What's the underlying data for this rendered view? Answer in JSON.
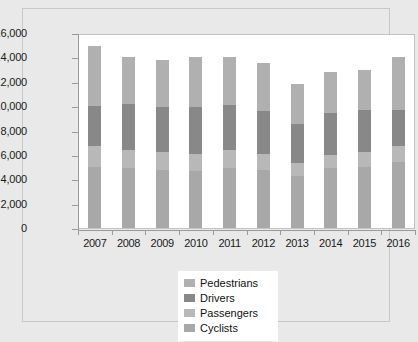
{
  "chart_data": {
    "type": "bar",
    "subtype": "stacked-bar",
    "title": "",
    "xlabel": "",
    "ylabel": "",
    "ylim": [
      0,
      16000
    ],
    "ytick_labels": [
      "16,000",
      "14,000",
      "12,000",
      "10,000",
      "8,000",
      "6,000",
      "4,000",
      "2,000",
      "0"
    ],
    "ytick_values": [
      16000,
      14000,
      12000,
      10000,
      8000,
      6000,
      4000,
      2000,
      0
    ],
    "grid": false,
    "legend_position": "bottom-center",
    "categories": [
      "2007",
      "2008",
      "2009",
      "2010",
      "2011",
      "2012",
      "2013",
      "2014",
      "2015",
      "2016"
    ],
    "stack_order_bottom_to_top": [
      "Cyclists",
      "Passengers",
      "Drivers",
      "Pedestrians"
    ],
    "series": [
      {
        "name": "Cyclists",
        "color": "#a8a8a8",
        "values": [
          5000,
          4900,
          4800,
          4700,
          4900,
          4800,
          4300,
          4900,
          5000,
          5400
        ]
      },
      {
        "name": "Passengers",
        "color": "#b8b8b8",
        "values": [
          1700,
          1500,
          1400,
          1400,
          1500,
          1300,
          1000,
          1100,
          1200,
          1300
        ]
      },
      {
        "name": "Drivers",
        "color": "#888888",
        "values": [
          3300,
          3800,
          3700,
          3800,
          3700,
          3500,
          3200,
          3400,
          3500,
          3000
        ]
      },
      {
        "name": "Pedestrians",
        "color": "#b0b0b0",
        "values": [
          4950,
          3800,
          3900,
          4100,
          3900,
          3900,
          3300,
          3400,
          3300,
          4300
        ]
      }
    ],
    "totals": [
      14950,
      14000,
      13800,
      14000,
      14000,
      13500,
      11800,
      12800,
      13000,
      14000
    ]
  },
  "legend": {
    "items": [
      {
        "label": "Pedestrians",
        "color": "#b0b0b0"
      },
      {
        "label": "Drivers",
        "color": "#888888"
      },
      {
        "label": "Passengers",
        "color": "#b8b8b8"
      },
      {
        "label": "Cyclists",
        "color": "#a8a8a8"
      }
    ]
  },
  "colors": {
    "page_background": "#e9e9e9",
    "plot_background": "#ffffff",
    "axis": "#9a9a9a",
    "text": "#1a1a1a",
    "frame_border": "#c8c8c8"
  }
}
